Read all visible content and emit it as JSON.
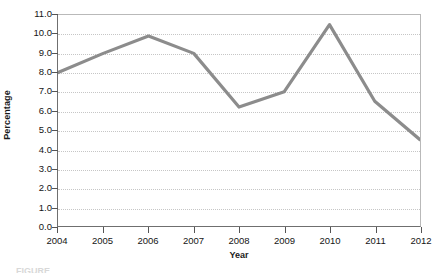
{
  "chart_data": {
    "type": "line",
    "title": "",
    "xlabel": "Year",
    "ylabel": "Percentage",
    "categories": [
      "2004",
      "2005",
      "2006",
      "2007",
      "2008",
      "2009",
      "2010",
      "2011",
      "2012"
    ],
    "x": [
      2004,
      2005,
      2006,
      2007,
      2008,
      2009,
      2010,
      2011,
      2012
    ],
    "values": [
      8.0,
      9.0,
      9.9,
      9.0,
      6.2,
      7.0,
      10.5,
      6.5,
      4.5
    ],
    "series": [
      {
        "name": "Percentage",
        "values": [
          8.0,
          9.0,
          9.9,
          9.0,
          6.2,
          7.0,
          10.5,
          6.5,
          4.5
        ],
        "color": "#8c8c8c"
      }
    ],
    "xlim": [
      2004,
      2012
    ],
    "ylim": [
      0.0,
      11.0
    ],
    "ytick_labels": [
      "11.0",
      "10.0",
      "9.0",
      "8.0",
      "7.0",
      "6.0",
      "5.0",
      "4.0",
      "3.0",
      "2.0",
      "1.0",
      "0.0"
    ],
    "yticks": [
      11.0,
      10.0,
      9.0,
      8.0,
      7.0,
      6.0,
      5.0,
      4.0,
      3.0,
      2.0,
      1.0,
      0.0
    ],
    "grid": true,
    "grid_axis": "y",
    "grid_style": "dotted",
    "legend": false,
    "legend_position": "none"
  },
  "axes": {
    "y_title": "Percentage",
    "x_title": "Year"
  },
  "caption": {
    "text": "FIGURE"
  },
  "colors": {
    "line": "#8c8c8c",
    "grid": "#c6c6c6",
    "axis": "#6f6f6f",
    "text": "#151515",
    "background": "#ffffff"
  }
}
